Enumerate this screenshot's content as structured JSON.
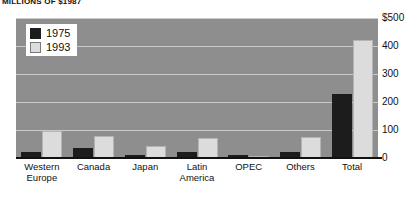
{
  "chart_data": {
    "type": "bar",
    "title": "MILLIONS OF $1987",
    "xlabel": "",
    "ylabel": "",
    "ylim": [
      0,
      500
    ],
    "yticks": [
      0,
      100,
      200,
      300,
      400,
      500
    ],
    "ytick_labels": [
      "0",
      "100",
      "200",
      "300",
      "400",
      "$500"
    ],
    "grid": true,
    "legend_position": "top-left",
    "categories": [
      "Western Europe",
      "Canada",
      "Japan",
      "Latin America",
      "OPEC",
      "Others",
      "Total"
    ],
    "category_lines": [
      [
        "Western",
        "Europe"
      ],
      [
        "Canada",
        ""
      ],
      [
        "Japan",
        ""
      ],
      [
        "Latin",
        "America"
      ],
      [
        "OPEC",
        ""
      ],
      [
        "Others",
        ""
      ],
      [
        "Total",
        ""
      ]
    ],
    "series": [
      {
        "name": "1975",
        "color": "#1c1c1c",
        "values": [
          22,
          37,
          9,
          22,
          11,
          23,
          230
        ]
      },
      {
        "name": "1993",
        "color": "#dcdcdc",
        "values": [
          96,
          80,
          44,
          70,
          5,
          75,
          420
        ]
      }
    ]
  },
  "legend": {
    "entries": [
      {
        "label": "1975"
      },
      {
        "label": "1993"
      }
    ]
  },
  "colors": {
    "plot_background": "#8e8e8e",
    "gridline": "#c9c9c9",
    "axis": "#111111",
    "series_1975": "#1c1c1c",
    "series_1993": "#dcdcdc"
  }
}
